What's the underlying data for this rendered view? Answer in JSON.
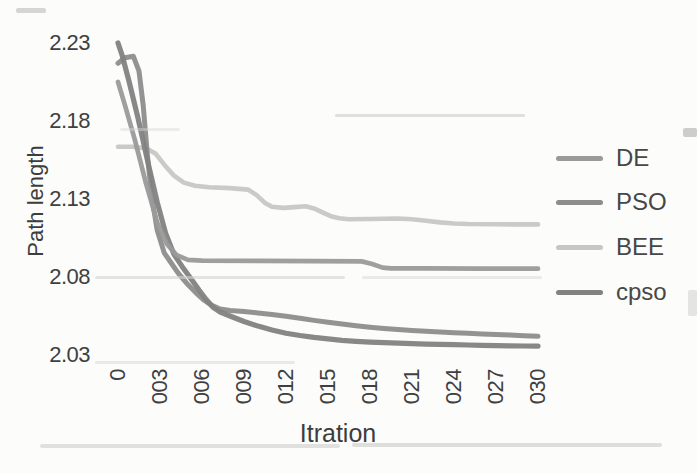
{
  "figure": {
    "background": "#fcfcfb"
  },
  "y_axis": {
    "title": "Path length",
    "tick_labels": [
      "2.23",
      "2.18",
      "2.13",
      "2.08",
      "2.03"
    ],
    "tick_values": [
      2.23,
      2.18,
      2.13,
      2.08,
      2.03
    ],
    "text_color": "#404040"
  },
  "x_axis": {
    "title": "Itration",
    "tick_labels": [
      "0",
      "003",
      "006",
      "009",
      "012",
      "015",
      "018",
      "021",
      "024",
      "027",
      "030"
    ],
    "tick_values": [
      0,
      3,
      6,
      9,
      12,
      15,
      18,
      21,
      24,
      27,
      30
    ],
    "text_color": "#404040"
  },
  "legend": {
    "items": [
      {
        "label": "DE",
        "series": "DE"
      },
      {
        "label": "PSO",
        "series": "PSO"
      },
      {
        "label": "BEE",
        "series": "BEE"
      },
      {
        "label": "cpso",
        "series": "cpso"
      }
    ]
  },
  "chart_data": {
    "type": "line",
    "title": "",
    "xlabel": "Itration",
    "ylabel": "Path length",
    "xlim": [
      0,
      30
    ],
    "ylim": [
      2.03,
      2.23
    ],
    "grid": false,
    "legend_position": "right",
    "series": [
      {
        "name": "BEE",
        "color": "#c7c7c4",
        "stroke_width": 4.6,
        "points": [
          [
            0,
            2.1635
          ],
          [
            1,
            2.1635
          ],
          [
            2,
            2.1625
          ],
          [
            2.7,
            2.159
          ],
          [
            3.3,
            2.152
          ],
          [
            4,
            2.145
          ],
          [
            4.7,
            2.1405
          ],
          [
            5.5,
            2.1385
          ],
          [
            6.5,
            2.1375
          ],
          [
            8,
            2.137
          ],
          [
            9.3,
            2.136
          ],
          [
            9.9,
            2.1325
          ],
          [
            10.5,
            2.1275
          ],
          [
            11,
            2.125
          ],
          [
            11.8,
            2.1243
          ],
          [
            12.6,
            2.1248
          ],
          [
            13.4,
            2.1253
          ],
          [
            14,
            2.124
          ],
          [
            14.6,
            2.1215
          ],
          [
            15.2,
            2.119
          ],
          [
            15.8,
            2.1177
          ],
          [
            16.5,
            2.117
          ],
          [
            18,
            2.1172
          ],
          [
            20,
            2.1175
          ],
          [
            21,
            2.117
          ],
          [
            22,
            2.116
          ],
          [
            23,
            2.115
          ],
          [
            24,
            2.1143
          ],
          [
            25,
            2.114
          ],
          [
            27,
            2.1138
          ],
          [
            30,
            2.1137
          ]
        ]
      },
      {
        "name": "PSO",
        "color": "#8d8d8d",
        "stroke_width": 5,
        "points": [
          [
            0,
            2.217
          ],
          [
            0.5,
            2.2205
          ],
          [
            1.1,
            2.2215
          ],
          [
            1.5,
            2.212
          ],
          [
            1.8,
            2.19
          ],
          [
            2.1,
            2.158
          ],
          [
            2.4,
            2.132
          ],
          [
            2.8,
            2.11
          ],
          [
            3.3,
            2.0955
          ],
          [
            3.8,
            2.089
          ],
          [
            4.3,
            2.0825
          ],
          [
            4.9,
            2.076
          ],
          [
            5.5,
            2.0705
          ],
          [
            6.1,
            2.0655
          ],
          [
            6.7,
            2.0618
          ],
          [
            7.3,
            2.0595
          ],
          [
            8,
            2.0585
          ],
          [
            9,
            2.0578
          ],
          [
            10,
            2.057
          ],
          [
            11,
            2.056
          ],
          [
            12,
            2.0548
          ],
          [
            13,
            2.0535
          ],
          [
            14,
            2.0522
          ],
          [
            15,
            2.051
          ],
          [
            16,
            2.0498
          ],
          [
            17,
            2.0488
          ],
          [
            18,
            2.0478
          ],
          [
            19,
            2.047
          ],
          [
            20,
            2.0463
          ],
          [
            21,
            2.0457
          ],
          [
            22,
            2.0452
          ],
          [
            23,
            2.0447
          ],
          [
            24,
            2.0443
          ],
          [
            25,
            2.0439
          ],
          [
            26,
            2.0435
          ],
          [
            27,
            2.0431
          ],
          [
            28,
            2.0428
          ],
          [
            29,
            2.0424
          ],
          [
            30,
            2.042
          ]
        ]
      },
      {
        "name": "cpso",
        "color": "#828282",
        "stroke_width": 5.2,
        "points": [
          [
            0,
            2.23
          ],
          [
            0.3,
            2.222
          ],
          [
            0.8,
            2.205
          ],
          [
            1.4,
            2.183
          ],
          [
            2.1,
            2.155
          ],
          [
            2.8,
            2.128
          ],
          [
            3.4,
            2.108
          ],
          [
            4,
            2.0945
          ],
          [
            4.6,
            2.0865
          ],
          [
            5.2,
            2.079
          ],
          [
            5.8,
            2.0715
          ],
          [
            6.3,
            2.0655
          ],
          [
            6.8,
            2.0605
          ],
          [
            7.3,
            2.0575
          ],
          [
            8,
            2.055
          ],
          [
            9,
            2.0515
          ],
          [
            10,
            2.0485
          ],
          [
            11,
            2.046
          ],
          [
            12,
            2.044
          ],
          [
            13,
            2.0425
          ],
          [
            14,
            2.0413
          ],
          [
            15,
            2.0403
          ],
          [
            16,
            2.0394
          ],
          [
            17,
            2.0388
          ],
          [
            18,
            2.0383
          ],
          [
            19,
            2.0379
          ],
          [
            20,
            2.0376
          ],
          [
            21,
            2.0373
          ],
          [
            22,
            2.037
          ],
          [
            23,
            2.0368
          ],
          [
            24,
            2.0366
          ],
          [
            25,
            2.0364
          ],
          [
            26,
            2.0362
          ],
          [
            27,
            2.036
          ],
          [
            28,
            2.0359
          ],
          [
            29,
            2.0358
          ],
          [
            30,
            2.0357
          ]
        ]
      },
      {
        "name": "DE",
        "color": "#9a9a9a",
        "stroke_width": 4.7,
        "points": [
          [
            0,
            2.205
          ],
          [
            0.5,
            2.19
          ],
          [
            1.2,
            2.168
          ],
          [
            2,
            2.14
          ],
          [
            2.8,
            2.115
          ],
          [
            3.5,
            2.101
          ],
          [
            4.2,
            2.094
          ],
          [
            5,
            2.091
          ],
          [
            6,
            2.0905
          ],
          [
            10,
            2.0903
          ],
          [
            14,
            2.0902
          ],
          [
            17.4,
            2.09
          ],
          [
            18.1,
            2.0885
          ],
          [
            18.9,
            2.086
          ],
          [
            19.5,
            2.0855
          ],
          [
            22,
            2.0855
          ],
          [
            26,
            2.0854
          ],
          [
            30,
            2.0853
          ]
        ]
      }
    ]
  },
  "noise_marks": [
    {
      "x": 16,
      "y": 8,
      "w": 30,
      "h": 5,
      "c": "#9a9a9a",
      "o": 0.4
    },
    {
      "x": 120,
      "y": 128,
      "w": 60,
      "h": 3,
      "c": "#d9d9d9",
      "o": 0.45
    },
    {
      "x": 335,
      "y": 114,
      "w": 190,
      "h": 3,
      "c": "#c2c2c2",
      "o": 0.5
    },
    {
      "x": 683,
      "y": 128,
      "w": 14,
      "h": 9,
      "c": "#aeaeae",
      "o": 0.6
    },
    {
      "x": 95,
      "y": 276,
      "w": 250,
      "h": 3,
      "c": "#d2d2d2",
      "o": 0.6
    },
    {
      "x": 362,
      "y": 276,
      "w": 180,
      "h": 3,
      "c": "#d8d8d8",
      "o": 0.5
    },
    {
      "x": 95,
      "y": 361,
      "w": 200,
      "h": 3,
      "c": "#d5d5d5",
      "o": 0.5
    },
    {
      "x": 688,
      "y": 290,
      "w": 9,
      "h": 26,
      "c": "#cccccc",
      "o": 0.5
    },
    {
      "x": 40,
      "y": 444,
      "w": 300,
      "h": 4,
      "c": "#c9c9c9",
      "o": 0.55
    },
    {
      "x": 352,
      "y": 443,
      "w": 310,
      "h": 4,
      "c": "#c4c4c4",
      "o": 0.55
    }
  ]
}
